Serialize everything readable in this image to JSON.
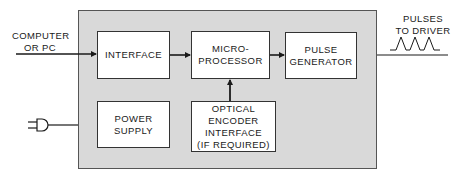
{
  "diagram": {
    "inputs": {
      "computer_label": "COMPUTER\nOR PC",
      "power_plug_icon": "power-plug-icon"
    },
    "outputs": {
      "pulses_label": "PULSES\nTO DRIVER",
      "pulse_waveform_icon": "pulse-waveform-icon"
    },
    "blocks": {
      "interface": "INTERFACE",
      "microprocessor": "MICRO-\nPROCESSOR",
      "pulse_generator": "PULSE\nGENERATOR",
      "power_supply": "POWER\nSUPPLY",
      "optical_encoder": "OPTICAL\nENCODER\nINTERFACE\n(IF REQUIRED)"
    },
    "colors": {
      "enclosure_fill": "#d9d9d9",
      "block_fill": "#ffffff",
      "line": "#1a1a1a"
    }
  }
}
